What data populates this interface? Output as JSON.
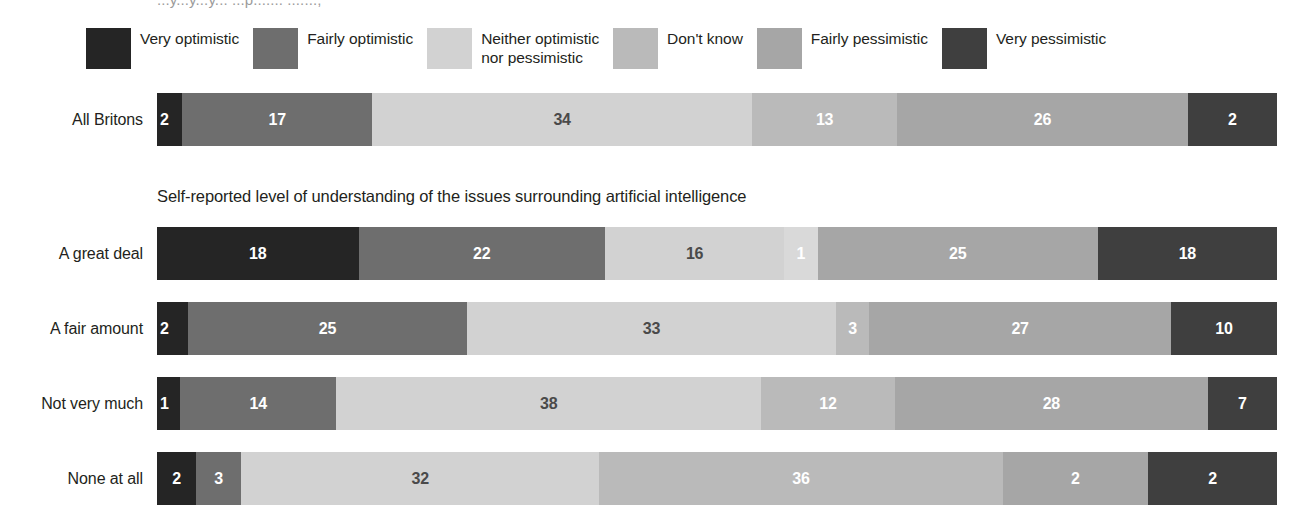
{
  "top_clipped_text": "...y...y...y... ...p....... .......,",
  "legend": {
    "items": [
      {
        "label": "Very optimistic",
        "color": "#252525",
        "key": "very_optimistic"
      },
      {
        "label": "Fairly optimistic",
        "color": "#6e6e6e",
        "key": "fairly_optimistic"
      },
      {
        "label": "Neither optimistic\nnor pessimistic",
        "color": "#d2d2d2",
        "key": "neither"
      },
      {
        "label": "Don't know",
        "color": "#bababa",
        "key": "dont_know"
      },
      {
        "label": "Fairly pessimistic",
        "color": "#a6a6a6",
        "key": "fairly_pessimistic"
      },
      {
        "label": "Very pessimistic",
        "color": "#3f3f3f",
        "key": "very_pessimistic"
      }
    ]
  },
  "subtitle": "Self-reported level of understanding of the issues surrounding artificial intelligence",
  "chart_data": {
    "type": "bar",
    "title": "",
    "subtitle": "Self-reported level of understanding of the issues surrounding artificial intelligence",
    "orientation": "horizontal",
    "stacked": true,
    "units": "percent",
    "xlabel": "",
    "ylabel": "",
    "xlim": [
      0,
      100
    ],
    "grid": false,
    "legend_position": "top",
    "categories": [
      "All Britons",
      "A great deal",
      "A fair amount",
      "Not very much",
      "None at all"
    ],
    "series": [
      {
        "name": "Very optimistic",
        "color": "#252525",
        "values": [
          2,
          18,
          2,
          1,
          2
        ]
      },
      {
        "name": "Fairly optimistic",
        "color": "#6e6e6e",
        "values": [
          17,
          22,
          25,
          14,
          3
        ]
      },
      {
        "name": "Neither optimistic nor pessimistic",
        "color": "#d2d2d2",
        "values": [
          34,
          16,
          33,
          38,
          32
        ]
      },
      {
        "name": "Don't know",
        "color": "#bababa",
        "values": [
          13,
          1,
          3,
          12,
          36
        ]
      },
      {
        "name": "Fairly pessimistic",
        "color": "#a6a6a6",
        "values": [
          26,
          25,
          27,
          28,
          2
        ]
      },
      {
        "name": "Very pessimistic",
        "color": "#3f3f3f",
        "values": [
          2,
          18,
          10,
          7,
          2
        ]
      }
    ]
  },
  "rows": [
    {
      "label": "All Britons",
      "top": 93,
      "segments": [
        {
          "value": "2",
          "pct": 2,
          "color": "#252525",
          "text": "#ffffff",
          "name": "very-optimistic",
          "align": "left"
        },
        {
          "value": "17",
          "pct": 17,
          "color": "#6e6e6e",
          "text": "#ffffff",
          "name": "fairly-optimistic",
          "align": "center"
        },
        {
          "value": "34",
          "pct": 34,
          "color": "#d2d2d2",
          "text": "#4a4a4a",
          "name": "neither",
          "align": "center"
        },
        {
          "value": "13",
          "pct": 13,
          "color": "#bababa",
          "text": "#ffffff",
          "name": "dont-know",
          "align": "center"
        },
        {
          "value": "26",
          "pct": 26,
          "color": "#a6a6a6",
          "text": "#ffffff",
          "name": "fairly-pessimistic",
          "align": "center"
        },
        {
          "value": "2",
          "pct": 8,
          "color": "#3f3f3f",
          "text": "#ffffff",
          "name": "very-pessimistic",
          "align": "center"
        }
      ]
    },
    {
      "label": "A great deal",
      "top": 227,
      "segments": [
        {
          "value": "18",
          "pct": 18,
          "color": "#252525",
          "text": "#ffffff",
          "name": "very-optimistic",
          "align": "center"
        },
        {
          "value": "22",
          "pct": 22,
          "color": "#6e6e6e",
          "text": "#ffffff",
          "name": "fairly-optimistic",
          "align": "center"
        },
        {
          "value": "16",
          "pct": 16,
          "color": "#d2d2d2",
          "text": "#4a4a4a",
          "name": "neither",
          "align": "center"
        },
        {
          "value": "1",
          "pct": 3,
          "color": "#d9d9d9",
          "text": "#ffffff",
          "name": "dont-know",
          "align": "center"
        },
        {
          "value": "25",
          "pct": 25,
          "color": "#a6a6a6",
          "text": "#ffffff",
          "name": "fairly-pessimistic",
          "align": "center"
        },
        {
          "value": "18",
          "pct": 16,
          "color": "#3f3f3f",
          "text": "#ffffff",
          "name": "very-pessimistic",
          "align": "center"
        }
      ]
    },
    {
      "label": "A fair amount",
      "top": 302,
      "segments": [
        {
          "value": "2",
          "pct": 2.5,
          "color": "#252525",
          "text": "#ffffff",
          "name": "very-optimistic",
          "align": "left"
        },
        {
          "value": "25",
          "pct": 25,
          "color": "#6e6e6e",
          "text": "#ffffff",
          "name": "fairly-optimistic",
          "align": "center"
        },
        {
          "value": "33",
          "pct": 33,
          "color": "#d2d2d2",
          "text": "#4a4a4a",
          "name": "neither",
          "align": "center"
        },
        {
          "value": "3",
          "pct": 3,
          "color": "#bababa",
          "text": "#ffffff",
          "name": "dont-know",
          "align": "center"
        },
        {
          "value": "27",
          "pct": 27,
          "color": "#a6a6a6",
          "text": "#ffffff",
          "name": "fairly-pessimistic",
          "align": "center"
        },
        {
          "value": "10",
          "pct": 9.5,
          "color": "#3f3f3f",
          "text": "#ffffff",
          "name": "very-pessimistic",
          "align": "center"
        }
      ]
    },
    {
      "label": "Not very much",
      "top": 377,
      "segments": [
        {
          "value": "1",
          "pct": 1.8,
          "color": "#252525",
          "text": "#ffffff",
          "name": "very-optimistic",
          "align": "left"
        },
        {
          "value": "14",
          "pct": 14,
          "color": "#6e6e6e",
          "text": "#ffffff",
          "name": "fairly-optimistic",
          "align": "center"
        },
        {
          "value": "38",
          "pct": 38,
          "color": "#d2d2d2",
          "text": "#4a4a4a",
          "name": "neither",
          "align": "center"
        },
        {
          "value": "12",
          "pct": 12,
          "color": "#bababa",
          "text": "#ffffff",
          "name": "dont-know",
          "align": "center"
        },
        {
          "value": "28",
          "pct": 28,
          "color": "#a6a6a6",
          "text": "#ffffff",
          "name": "fairly-pessimistic",
          "align": "center"
        },
        {
          "value": "7",
          "pct": 6.2,
          "color": "#3f3f3f",
          "text": "#ffffff",
          "name": "very-pessimistic",
          "align": "center"
        }
      ]
    },
    {
      "label": "None at all",
      "top": 452,
      "segments": [
        {
          "value": "2",
          "pct": 3.5,
          "color": "#252525",
          "text": "#ffffff",
          "name": "very-optimistic",
          "align": "center"
        },
        {
          "value": "3",
          "pct": 4,
          "color": "#6e6e6e",
          "text": "#ffffff",
          "name": "fairly-optimistic",
          "align": "center"
        },
        {
          "value": "32",
          "pct": 32,
          "color": "#d2d2d2",
          "text": "#4a4a4a",
          "name": "neither",
          "align": "center"
        },
        {
          "value": "36",
          "pct": 36,
          "color": "#bababa",
          "text": "#ffffff",
          "name": "dont-know",
          "align": "center"
        },
        {
          "value": "2",
          "pct": 13,
          "color": "#a6a6a6",
          "text": "#ffffff",
          "name": "fairly-pessimistic",
          "align": "center"
        },
        {
          "value": "2",
          "pct": 11.5,
          "color": "#3f3f3f",
          "text": "#ffffff",
          "name": "very-pessimistic",
          "align": "center"
        }
      ]
    }
  ]
}
